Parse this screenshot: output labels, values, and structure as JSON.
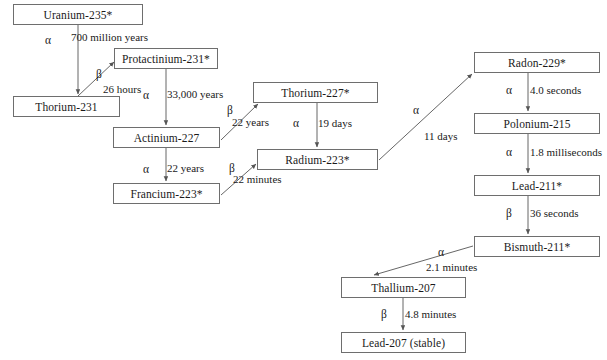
{
  "diagram": {
    "type": "decay-chain-flowchart",
    "colors": {
      "box_border": "#6e6e6e",
      "arrow": "#555555",
      "text": "#1a1a1a",
      "background": "#ffffff"
    },
    "nodes": [
      {
        "id": "u235",
        "label": "Uranium-235*",
        "x": 13,
        "y": 4,
        "w": 130,
        "h": 21
      },
      {
        "id": "th231",
        "label": "Thorium-231",
        "x": 13,
        "y": 96,
        "w": 107,
        "h": 21
      },
      {
        "id": "pa231",
        "label": "Protactinium-231*",
        "x": 114,
        "y": 48,
        "w": 104,
        "h": 21
      },
      {
        "id": "ac227",
        "label": "Actinium-227",
        "x": 113,
        "y": 127,
        "w": 107,
        "h": 21
      },
      {
        "id": "fr223",
        "label": "Francium-223*",
        "x": 113,
        "y": 183,
        "w": 107,
        "h": 21
      },
      {
        "id": "th227",
        "label": "Thorium-227*",
        "x": 253,
        "y": 82,
        "w": 125,
        "h": 21
      },
      {
        "id": "ra223",
        "label": "Radium-223*",
        "x": 257,
        "y": 149,
        "w": 121,
        "h": 21
      },
      {
        "id": "rn229",
        "label": "Radon-229*",
        "x": 474,
        "y": 52,
        "w": 126,
        "h": 21
      },
      {
        "id": "po215",
        "label": "Polonium-215",
        "x": 474,
        "y": 113,
        "w": 126,
        "h": 21
      },
      {
        "id": "pb211",
        "label": "Lead-211*",
        "x": 474,
        "y": 175,
        "w": 126,
        "h": 21
      },
      {
        "id": "bi211",
        "label": "Bismuth-211*",
        "x": 474,
        "y": 236,
        "w": 126,
        "h": 21
      },
      {
        "id": "tl207",
        "label": "Thallium-207",
        "x": 341,
        "y": 277,
        "w": 125,
        "h": 21
      },
      {
        "id": "pb207",
        "label": "Lead-207 (stable)",
        "x": 341,
        "y": 332,
        "w": 125,
        "h": 21
      }
    ],
    "edges": [
      {
        "id": "e1",
        "from": "u235",
        "to": "th231",
        "particle": "α",
        "halflife": "700 million years",
        "x1": 78,
        "y1": 25,
        "x2": 78,
        "y2": 94,
        "particle_x": 45,
        "particle_y": 34,
        "halflife_x": 71,
        "halflife_y": 31
      },
      {
        "id": "e2",
        "from": "th231",
        "to": "pa231",
        "particle": "β",
        "halflife": "26 hours",
        "x1": 78,
        "y1": 96,
        "x2": 114,
        "y2": 62,
        "particle_x": 96,
        "particle_y": 68,
        "halflife_x": 103,
        "halflife_y": 83
      },
      {
        "id": "e3",
        "from": "pa231",
        "to": "ac227",
        "particle": "α",
        "halflife": "33,000 years",
        "x1": 166,
        "y1": 69,
        "x2": 166,
        "y2": 125,
        "particle_x": 143,
        "particle_y": 89,
        "halflife_x": 167,
        "halflife_y": 88
      },
      {
        "id": "e4",
        "from": "ac227",
        "to": "th227",
        "particle": "β",
        "halflife": "22 years",
        "x1": 221,
        "y1": 140,
        "x2": 258,
        "y2": 104,
        "particle_x": 227,
        "particle_y": 104,
        "halflife_x": 232,
        "halfley": 0,
        "halflife_y": 116
      },
      {
        "id": "e5",
        "from": "ac227",
        "to": "fr223",
        "particle": "α",
        "halflife": "22 years",
        "x1": 166,
        "y1": 148,
        "x2": 166,
        "y2": 181,
        "particle_x": 143,
        "particle_y": 163,
        "halflife_x": 167,
        "halflife_y": 162
      },
      {
        "id": "e6",
        "from": "th227",
        "to": "ra223",
        "particle": "α",
        "halflife": "19 days",
        "x1": 317,
        "y1": 103,
        "x2": 317,
        "y2": 147,
        "particle_x": 293,
        "particle_y": 117,
        "halflife_x": 318,
        "halflife_y": 117
      },
      {
        "id": "e7",
        "from": "fr223",
        "to": "ra223",
        "particle": "β",
        "halflife": "22 minutes",
        "x1": 221,
        "y1": 195,
        "x2": 256,
        "y2": 164,
        "particle_x": 229,
        "particle_y": 162,
        "halflife_x": 233,
        "halflife_y": 173
      },
      {
        "id": "e8",
        "from": "ra223",
        "to": "rn229",
        "particle": "α",
        "halflife": "11 days",
        "x1": 379,
        "y1": 160,
        "x2": 472,
        "y2": 74,
        "particle_x": 413,
        "particle_y": 104,
        "halflife_x": 424,
        "halflife_y": 130
      },
      {
        "id": "e9",
        "from": "rn229",
        "to": "po215",
        "particle": "α",
        "halflife": "4.0 seconds",
        "x1": 528,
        "y1": 73,
        "x2": 528,
        "y2": 111,
        "particle_x": 506,
        "particle_y": 84,
        "halflife_x": 530,
        "halflife_y": 84
      },
      {
        "id": "e10",
        "from": "po215",
        "to": "pb211",
        "particle": "α",
        "halflife": "1.8 milliseconds",
        "x1": 528,
        "y1": 134,
        "x2": 528,
        "y2": 173,
        "particle_x": 506,
        "particle_y": 146,
        "halflife_x": 530,
        "halflife_y": 146
      },
      {
        "id": "e11",
        "from": "pb211",
        "to": "bi211",
        "particle": "β",
        "halflife": "36 seconds",
        "x1": 528,
        "y1": 196,
        "x2": 528,
        "y2": 234,
        "particle_x": 506,
        "particle_y": 207,
        "halflife_x": 530,
        "halflife_y": 207
      },
      {
        "id": "e12",
        "from": "bi211",
        "to": "tl207",
        "particle": "α",
        "halflife": "2.1 minutes",
        "x1": 473,
        "y1": 246,
        "x2": 374,
        "y2": 275,
        "particle_x": 438,
        "particle_y": 246,
        "halflife_x": 426,
        "halflife_y": 261
      },
      {
        "id": "e13",
        "from": "tl207",
        "to": "pb207",
        "particle": "β",
        "halflife": "4.8 minutes",
        "x1": 403,
        "y1": 298,
        "x2": 403,
        "y2": 330,
        "particle_x": 381,
        "particle_y": 308,
        "halflife_x": 405,
        "halflife_y": 308
      }
    ]
  }
}
